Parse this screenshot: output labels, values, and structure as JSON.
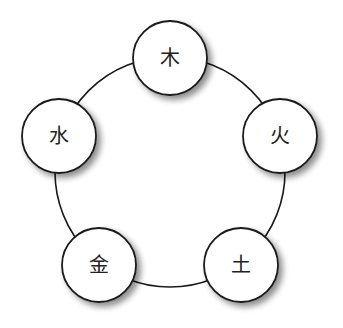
{
  "diagram": {
    "type": "cycle",
    "ring": {
      "cx": 170,
      "cy": 172,
      "r": 115,
      "stroke": "#1a1a1a",
      "stroke_width": 1.6
    },
    "node_style": {
      "r": 37,
      "fill": "#ffffff",
      "stroke": "#1a1a1a",
      "stroke_width": 1.8,
      "shadow_color": "#000000"
    },
    "nodes": [
      {
        "id": "wood",
        "label": "木",
        "cx": 170,
        "cy": 58
      },
      {
        "id": "fire",
        "label": "火",
        "cx": 280,
        "cy": 136
      },
      {
        "id": "earth",
        "label": "土",
        "cx": 241,
        "cy": 265
      },
      {
        "id": "metal",
        "label": "金",
        "cx": 99,
        "cy": 265
      },
      {
        "id": "water",
        "label": "水",
        "cx": 59,
        "cy": 136
      }
    ]
  }
}
